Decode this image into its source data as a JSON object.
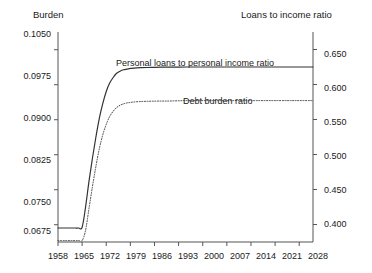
{
  "chart_data": {
    "type": "line",
    "title": "",
    "left_axis": {
      "label": "Burden",
      "ticks": [
        "0.1050",
        "0.0975",
        "0.0900",
        "0.0825",
        "0.0750",
        "0.0675"
      ],
      "tick_values": [
        0.105,
        0.0975,
        0.09,
        0.0825,
        0.075,
        0.0675
      ],
      "ylim": [
        0.0638,
        0.1088
      ],
      "grid": false
    },
    "right_axis": {
      "label": "Loans to income ratio",
      "ticks": [
        "0.650",
        "0.600",
        "0.550",
        "0.500",
        "0.450",
        "0.400"
      ],
      "tick_values": [
        0.65,
        0.6,
        0.55,
        0.5,
        0.45,
        0.4
      ],
      "ylim": [
        0.375,
        0.675
      ],
      "grid": false
    },
    "xlabel": "",
    "x_ticks": [
      "1958",
      "1965",
      "1972",
      "1979",
      "1986",
      "1993",
      "2000",
      "2007",
      "2014",
      "2021",
      "2028"
    ],
    "x_tick_values": [
      1958,
      1965,
      1972,
      1979,
      1986,
      1993,
      2000,
      2007,
      2014,
      2021,
      2028
    ],
    "xlim": [
      1958,
      2032
    ],
    "legend_position": "inline-annotations",
    "series": [
      {
        "name": "Personal loans to personal income ratio",
        "style": "solid",
        "color": "#333333",
        "axis": "right",
        "x": [
          1958,
          1959,
          1960,
          1961,
          1962,
          1963,
          1964,
          1965,
          1966,
          1967,
          1968,
          1969,
          1970,
          1971,
          1972,
          1973,
          1974,
          1975,
          1976,
          1977,
          1978,
          1979,
          1980,
          1982,
          1984,
          1986,
          1988,
          1990,
          1995,
          2000,
          2005,
          2010,
          2015,
          2020,
          2025,
          2028,
          2032
        ],
        "values": [
          0.395,
          0.395,
          0.395,
          0.395,
          0.395,
          0.395,
          0.395,
          0.396,
          0.425,
          0.462,
          0.495,
          0.525,
          0.552,
          0.573,
          0.59,
          0.602,
          0.61,
          0.616,
          0.619,
          0.621,
          0.622,
          0.623,
          0.6235,
          0.624,
          0.6243,
          0.6245,
          0.6247,
          0.6248,
          0.625,
          0.625,
          0.625,
          0.625,
          0.625,
          0.625,
          0.625,
          0.625,
          0.625
        ]
      },
      {
        "name": "Debt burden ratio",
        "style": "dotted",
        "color": "#444444",
        "axis": "left",
        "x": [
          1958,
          1959,
          1960,
          1961,
          1962,
          1963,
          1964,
          1965,
          1966,
          1967,
          1968,
          1969,
          1970,
          1971,
          1972,
          1973,
          1974,
          1975,
          1976,
          1977,
          1978,
          1979,
          1980,
          1982,
          1984,
          1986,
          1988,
          1990,
          1995,
          2000,
          2005,
          2010,
          2015,
          2020,
          2025,
          2028,
          2032
        ],
        "values": [
          0.0641,
          0.0641,
          0.0641,
          0.0641,
          0.0641,
          0.0641,
          0.0641,
          0.0641,
          0.0663,
          0.071,
          0.0757,
          0.08,
          0.0838,
          0.0868,
          0.089,
          0.0907,
          0.0918,
          0.0926,
          0.0931,
          0.0934,
          0.0936,
          0.0937,
          0.0938,
          0.0939,
          0.09395,
          0.09398,
          0.094,
          0.094,
          0.0941,
          0.0941,
          0.0941,
          0.0941,
          0.0941,
          0.0941,
          0.0941,
          0.0941,
          0.0941
        ]
      }
    ],
    "annotations": [
      {
        "text": "Personal loans to personal income ratio",
        "x": 1972,
        "y": 0.655
      },
      {
        "text": "Debt burden ratio",
        "x": 1995,
        "y": 0.592
      }
    ]
  },
  "labels": {
    "left_axis_title": "Burden",
    "right_axis_title": "Loans to income ratio",
    "series_solid": "Personal loans to personal income ratio",
    "series_dotted": "Debt burden ratio"
  },
  "colors": {
    "background": "#ffffff",
    "axis": "#555555",
    "text": "#1a1a1a",
    "solid_line": "#333333",
    "dotted_line": "#444444"
  }
}
